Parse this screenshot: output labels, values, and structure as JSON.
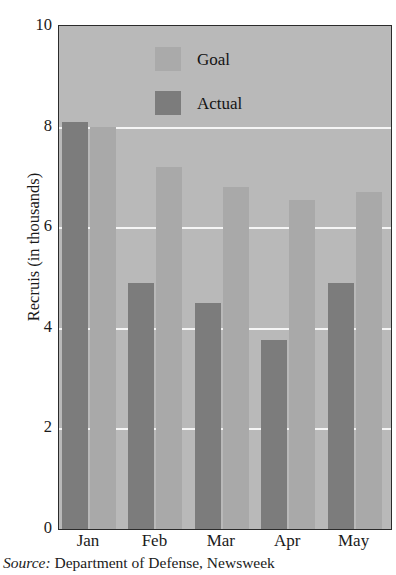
{
  "scan_artifact_text": "",
  "chart_data": {
    "type": "bar",
    "title": "",
    "subtitle": "",
    "xlabel": "",
    "ylabel": "Recruis (in thousands)",
    "categories": [
      "Jan",
      "Feb",
      "Mar",
      "Apr",
      "May"
    ],
    "series": [
      {
        "name": "Actual",
        "color": "#7c7c7c",
        "values": [
          8.1,
          4.9,
          4.5,
          3.75,
          4.9
        ]
      },
      {
        "name": "Goal",
        "color": "#a9a9a9",
        "values": [
          8.0,
          7.2,
          6.8,
          6.55,
          6.7
        ]
      }
    ],
    "series_draw_order": [
      "Actual",
      "Goal"
    ],
    "legend_order": [
      "Goal",
      "Actual"
    ],
    "legend_position": "inside-top-center",
    "ylim": [
      0,
      10
    ],
    "yticks": [
      0,
      2,
      4,
      6,
      8,
      10
    ],
    "ytick_labels": [
      "0",
      "2",
      "4",
      "6",
      "8",
      "10"
    ],
    "gridlines": {
      "show": true,
      "axis": "y",
      "values": [
        2,
        4,
        6,
        8
      ],
      "color": "#f5f5f5"
    },
    "plot_background": "#b9b9b9",
    "plot_border_color": "#2b2b2b",
    "annotations": []
  },
  "axis": {
    "y_title": "Recruis (in thousands)",
    "y_ticks": [
      {
        "value": 10,
        "label": "10"
      },
      {
        "value": 8,
        "label": "8"
      },
      {
        "value": 6,
        "label": "6"
      },
      {
        "value": 4,
        "label": "4"
      },
      {
        "value": 2,
        "label": "2"
      },
      {
        "value": 0,
        "label": "0"
      }
    ],
    "x_ticks": [
      {
        "label": "Jan"
      },
      {
        "label": "Feb"
      },
      {
        "label": "Mar"
      },
      {
        "label": "Apr"
      },
      {
        "label": "May"
      }
    ]
  },
  "legend": {
    "items": [
      {
        "label": "Goal",
        "swatch": "goal"
      },
      {
        "label": "Actual",
        "swatch": "actual"
      }
    ]
  },
  "source": {
    "prefix": "Source:",
    "text": " Department of Defense, Newsweek"
  }
}
